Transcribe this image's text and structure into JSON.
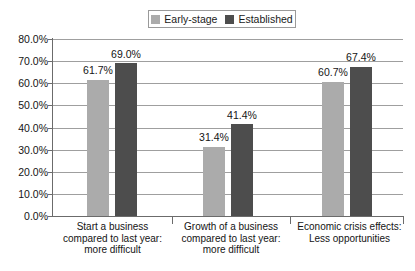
{
  "chart_data": {
    "type": "bar",
    "title": "",
    "subtitle": "",
    "xlabel": "",
    "ylabel": "",
    "ylim": [
      0,
      80
    ],
    "ytick_labels": [
      "0.0%",
      "10.0%",
      "20.0%",
      "30.0%",
      "40.0%",
      "50.0%",
      "60.0%",
      "70.0%",
      "80.0%"
    ],
    "ytick_values": [
      0,
      10,
      20,
      30,
      40,
      50,
      60,
      70,
      80
    ],
    "grid": "horizontal",
    "legend_position": "top-center",
    "categories": [
      "Start a business compared to last year: more difficult",
      "Growth of a business compared to last year: more difficult",
      "Economic crisis effects: Less opportunities"
    ],
    "category_lines": [
      [
        "Start a business",
        "compared to last year:",
        "more difficult"
      ],
      [
        "Growth of a business",
        "compared to last year:",
        "more difficult"
      ],
      [
        "Economic crisis effects:",
        "Less opportunities"
      ]
    ],
    "series": [
      {
        "name": "Early-stage",
        "color": "#ababab",
        "values": [
          61.7,
          31.4,
          60.7
        ],
        "labels": [
          "61.7%",
          "31.4%",
          "60.7%"
        ]
      },
      {
        "name": "Established",
        "color": "#4d4d4d",
        "values": [
          69.0,
          41.4,
          67.4
        ],
        "labels": [
          "69.0%",
          "41.4%",
          "67.4%"
        ]
      }
    ]
  },
  "legend": {
    "items": [
      {
        "label": "Early-stage",
        "color": "#ababab"
      },
      {
        "label": "Established",
        "color": "#4d4d4d"
      }
    ]
  },
  "axes": {
    "y": {
      "ticks": [
        {
          "label": "80.0%",
          "value": 80
        },
        {
          "label": "70.0%",
          "value": 70
        },
        {
          "label": "60.0%",
          "value": 60
        },
        {
          "label": "50.0%",
          "value": 50
        },
        {
          "label": "40.0%",
          "value": 40
        },
        {
          "label": "30.0%",
          "value": 30
        },
        {
          "label": "20.0%",
          "value": 20
        },
        {
          "label": "10.0%",
          "value": 10
        },
        {
          "label": "0.0%",
          "value": 0
        }
      ]
    }
  }
}
